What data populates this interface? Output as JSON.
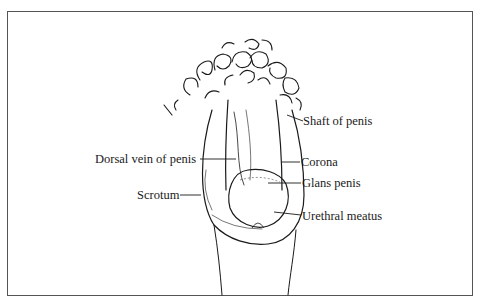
{
  "diagram": {
    "type": "anatomical illustration",
    "style": "line drawing, black ink on white, framed",
    "labels": [
      {
        "id": "shaft",
        "text": "Shaft of penis",
        "side": "right"
      },
      {
        "id": "dorsal-vein",
        "text": "Dorsal vein of penis",
        "side": "left"
      },
      {
        "id": "corona",
        "text": "Corona",
        "side": "right"
      },
      {
        "id": "glans",
        "text": "Glans penis",
        "side": "right"
      },
      {
        "id": "scrotum",
        "text": "Scrotum",
        "side": "left"
      },
      {
        "id": "meatus",
        "text": "Urethral meatus",
        "side": "right"
      }
    ]
  },
  "colors": {
    "ink": "#1a1a1a",
    "frame": "#555555",
    "background": "#ffffff"
  }
}
